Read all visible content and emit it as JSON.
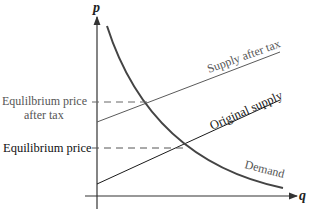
{
  "diagram": {
    "title": "",
    "axes": {
      "y_label": "p",
      "x_label": "q"
    },
    "curves": {
      "demand": {
        "label": "Demand",
        "color": "#4a4a4a"
      },
      "supply_after_tax": {
        "label": "Supply after tax",
        "color": "#5a5a5a"
      },
      "original_supply": {
        "label": "Original supply",
        "color": "#1a1a1a"
      }
    },
    "levels": {
      "equilibrium_after_tax": {
        "label_line1": "Equlilbrium price",
        "label_line2": "after tax",
        "color": "#555555"
      },
      "equilibrium": {
        "label": "Equilibrium price",
        "color": "#111111"
      }
    }
  }
}
